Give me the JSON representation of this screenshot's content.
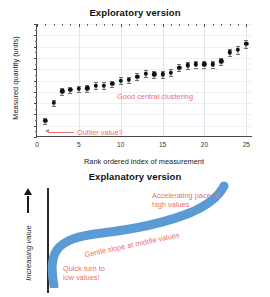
{
  "figure": {
    "panels": [
      {
        "id": "exploratory",
        "title": "Exploratory version"
      },
      {
        "id": "explanatory",
        "title": "Explanatory version"
      }
    ]
  },
  "exploratory": {
    "title": "Exploratory version",
    "xlabel": "Rank ordered index of measurement",
    "ylabel": "Measured quantity (units)",
    "yticks": [
      "0",
      "2",
      "4",
      "6",
      "8",
      "10",
      "12",
      "14",
      "16",
      "18",
      "20"
    ],
    "xticks": [
      "0",
      "5",
      "10",
      "15",
      "20",
      "25"
    ],
    "annotations": {
      "outlier": "Outlier value?",
      "clustering": "Good central clustering"
    }
  },
  "explanatory": {
    "title": "Explanatory version",
    "ylabel": "Increasing value",
    "annotations": {
      "accelerating_line1": "Accelerating pace at",
      "accelerating_line2": "high values",
      "gentle": "Gentle slope at middle values",
      "quick_line1": "Quick turn to",
      "quick_line2": "low values!"
    },
    "curve_color": "#5b9bd5"
  },
  "colors": {
    "annotation": "#e8736a",
    "marker": "#111111",
    "errorbar": "#6f6f6f",
    "axis": "#4a4a4a",
    "grid": "#e3e6ef",
    "curve": "#5b9bd5"
  },
  "chart_data": {
    "type": "scatter",
    "title": "Exploratory version",
    "xlabel": "Rank ordered index of measurement",
    "ylabel": "Measured quantity (units)",
    "xlim": [
      0,
      25.8
    ],
    "ylim": [
      0,
      20
    ],
    "xticks": [
      0,
      5,
      10,
      15,
      20,
      25
    ],
    "yticks": [
      0,
      2,
      4,
      6,
      8,
      10,
      12,
      14,
      16,
      18,
      20
    ],
    "grid": true,
    "legend": null,
    "errorbars": true,
    "x": [
      1,
      2,
      3,
      4,
      5,
      6,
      7,
      8,
      9,
      10,
      11,
      12,
      13,
      14,
      15,
      16,
      17,
      18,
      19,
      20,
      21,
      22,
      23,
      24,
      25
    ],
    "y": [
      2.9,
      6.0,
      8.1,
      8.3,
      8.5,
      8.6,
      9.1,
      9.1,
      9.4,
      10.0,
      10.1,
      10.7,
      11.2,
      11.1,
      11.1,
      11.4,
      12.3,
      12.7,
      12.9,
      12.9,
      12.9,
      13.4,
      15.0,
      15.4,
      16.5
    ],
    "yerr": [
      0.55,
      0.55,
      0.6,
      0.6,
      0.6,
      0.6,
      0.6,
      0.6,
      0.6,
      0.6,
      0.6,
      0.6,
      0.65,
      0.65,
      0.65,
      0.65,
      0.6,
      0.6,
      0.6,
      0.6,
      0.6,
      0.6,
      0.6,
      0.7,
      0.7
    ],
    "annotations": [
      {
        "text": "Outlier value?",
        "target_x": 1,
        "target_y": 2.9
      },
      {
        "text": "Good central clustering",
        "target_x": 13,
        "target_y": 7.2
      }
    ],
    "companion_panel": {
      "type": "line",
      "title": "Explanatory version",
      "ylabel": "Increasing value",
      "description": "Smoothed schematic version of the same rank-ordered curve drawn as one thick blue line",
      "annotations": [
        "Quick turn to low values!",
        "Gentle slope at middle values",
        "Accelerating pace at high values"
      ]
    }
  }
}
